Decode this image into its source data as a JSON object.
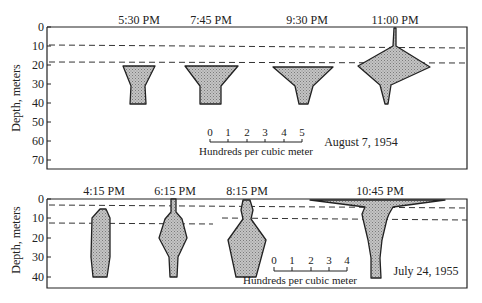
{
  "figure": {
    "top_panel": {
      "date": "August 7, 1954",
      "ylabel": "Depth, meters",
      "y_ticks": [
        "0",
        "10",
        "20",
        "30",
        "40",
        "50",
        "60",
        "70"
      ],
      "times": [
        "5:30 PM",
        "7:45 PM",
        "9:30 PM",
        "11:00 PM"
      ],
      "scale": {
        "ticks": [
          "0",
          "1",
          "2",
          "3",
          "4",
          "5"
        ],
        "label": "Hundreds per cubic meter"
      },
      "dashed_lines_depth_m": [
        10,
        19
      ]
    },
    "bottom_panel": {
      "date": "July 24, 1955",
      "ylabel": "Depth, meters",
      "y_ticks": [
        "0",
        "10",
        "20",
        "30",
        "40"
      ],
      "times": [
        "4:15 PM",
        "6:15 PM",
        "8:15 PM",
        "10:45 PM"
      ],
      "scale": {
        "ticks": [
          "0",
          "1",
          "2",
          "3",
          "4"
        ],
        "label": "Hundreds per cubic meter"
      },
      "dashed_lines_depth_m": [
        3,
        12
      ]
    },
    "colors": {
      "ink": "#222222",
      "fill": "#b8b8b8",
      "background": "#ffffff"
    }
  }
}
